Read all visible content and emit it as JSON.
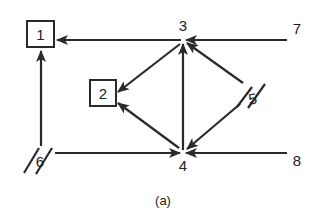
{
  "caption": "(a)",
  "nodes": [
    {
      "id": "1",
      "label": "1",
      "shape": "box"
    },
    {
      "id": "2",
      "label": "2",
      "shape": "box"
    },
    {
      "id": "3",
      "label": "3",
      "shape": "point"
    },
    {
      "id": "4",
      "label": "4",
      "shape": "point"
    },
    {
      "id": "5",
      "label": "5",
      "shape": "double-slash"
    },
    {
      "id": "6",
      "label": "6",
      "shape": "double-slash"
    },
    {
      "id": "7",
      "label": "7",
      "shape": "point"
    },
    {
      "id": "8",
      "label": "8",
      "shape": "point"
    }
  ],
  "edges": [
    {
      "from": "3",
      "to": "1"
    },
    {
      "from": "7",
      "to": "3"
    },
    {
      "from": "3",
      "to": "2"
    },
    {
      "from": "4",
      "to": "2"
    },
    {
      "from": "4",
      "to": "3"
    },
    {
      "from": "5",
      "to": "3"
    },
    {
      "from": "5",
      "to": "4"
    },
    {
      "from": "6",
      "to": "1"
    },
    {
      "from": "6",
      "to": "4"
    },
    {
      "from": "8",
      "to": "4"
    }
  ],
  "colors": {
    "ink": "#2a2a2a",
    "background": "#ffffff"
  }
}
